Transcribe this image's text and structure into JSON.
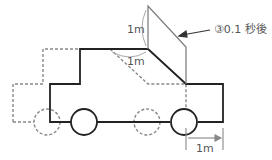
{
  "diagram": {
    "labels": {
      "vertical_height": "1m",
      "diagonal_length": "1m",
      "displacement": "1m",
      "annotation": "③0.1 秒後"
    },
    "colors": {
      "solid_car": "#222222",
      "dashed_car": "#888888",
      "board": "#777777",
      "text": "#555555"
    }
  }
}
